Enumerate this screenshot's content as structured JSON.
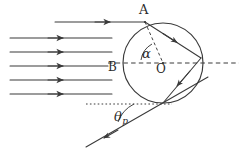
{
  "figure": {
    "stroke_color": "#3a3a3a",
    "background_color": "#ffffff",
    "width": 239,
    "height": 157,
    "labels": {
      "point_a": "A",
      "point_b": "B",
      "center_o": "O",
      "angle_alpha": "α",
      "angle_theta": "θ",
      "angle_theta_subscript": "p"
    },
    "circle": {
      "center_x": 163,
      "center_y": 63,
      "radius": 40
    },
    "incident_rays": {
      "count": 6,
      "y_positions": [
        22,
        38,
        52,
        66,
        80,
        94
      ],
      "x_start": [
        55,
        10,
        10,
        10,
        10,
        10
      ],
      "x_end": [
        145,
        112,
        112,
        112,
        112,
        112
      ]
    },
    "internal_path": {
      "entry_point": [
        145,
        22
      ],
      "reflection_point": [
        201,
        58
      ],
      "exit_point": [
        163,
        103
      ]
    },
    "exit_ray": {
      "from": [
        163,
        103
      ],
      "to": [
        86,
        147
      ]
    },
    "axis_dashed": {
      "y": 63,
      "x_start": 108,
      "x_end": 239
    },
    "axis_dotted_lower": {
      "y": 104,
      "x_start": 86,
      "x_end": 172
    },
    "normal_dashed": {
      "from": [
        145,
        22
      ],
      "to": [
        163,
        63
      ]
    }
  }
}
